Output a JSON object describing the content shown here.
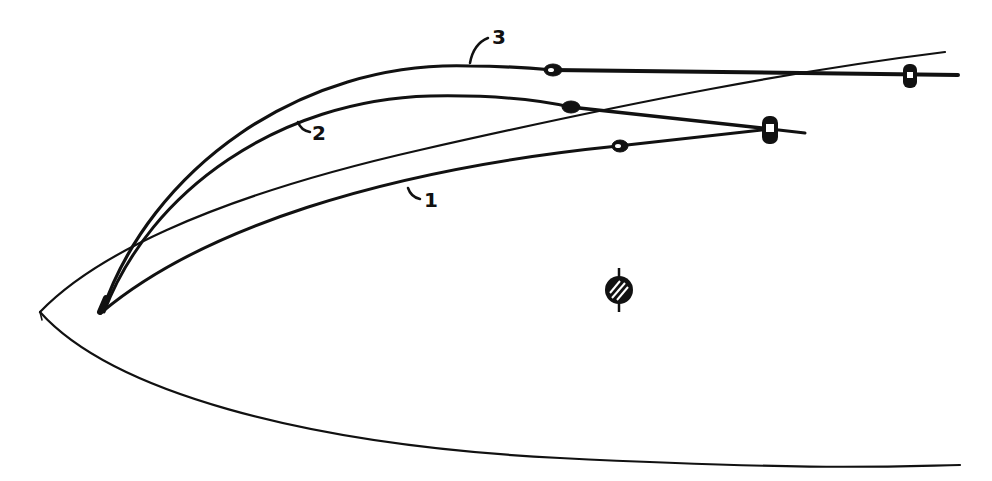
{
  "diagram": {
    "type": "sail-sheet-positions",
    "colors": {
      "ink": "#111111",
      "background": "#ffffff"
    },
    "labels": [
      {
        "id": "1",
        "text": "1",
        "x": 428,
        "y": 207
      },
      {
        "id": "2",
        "text": "2",
        "x": 313,
        "y": 140
      },
      {
        "id": "3",
        "text": "3",
        "x": 494,
        "y": 44
      }
    ],
    "elements": [
      {
        "name": "hull-outline",
        "description": "bow of hull seen from above"
      },
      {
        "name": "sail-curve-1",
        "description": "sail position 1 with sheet to block"
      },
      {
        "name": "sail-curve-2",
        "description": "sail position 2 with sheet to block"
      },
      {
        "name": "sail-curve-3",
        "description": "sail position 3 with sheet to aft block"
      },
      {
        "name": "mast",
        "description": "hatched circle representing mast"
      }
    ]
  }
}
